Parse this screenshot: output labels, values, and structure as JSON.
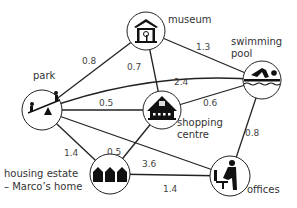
{
  "nodes": {
    "museum": {
      "label": "museum",
      "x": 146,
      "y": 31
    },
    "park": {
      "label": "park",
      "x": 42,
      "y": 110
    },
    "shopping": {
      "label1": "shopping",
      "label2": "centre",
      "x": 162,
      "y": 110
    },
    "pool": {
      "label1": "swimming",
      "label2": "pool",
      "x": 262,
      "y": 80
    },
    "housing": {
      "label1": "housing estate",
      "label2": "– Marco’s home",
      "x": 110,
      "y": 174
    },
    "offices": {
      "label": "offices",
      "x": 230,
      "y": 176
    }
  },
  "edges": [
    {
      "from": "park",
      "to": "museum",
      "weight": "0.8"
    },
    {
      "from": "museum",
      "to": "pool",
      "weight": "1.3"
    },
    {
      "from": "museum",
      "to": "shopping",
      "weight": "0.7"
    },
    {
      "from": "park",
      "to": "pool",
      "weight": "2.4"
    },
    {
      "from": "park",
      "to": "shopping",
      "weight": "0.5"
    },
    {
      "from": "shopping",
      "to": "pool",
      "weight": "0.6"
    },
    {
      "from": "park",
      "to": "housing",
      "weight": "1.4"
    },
    {
      "from": "park",
      "to": "offices",
      "weight": "3.6"
    },
    {
      "from": "housing",
      "to": "shopping",
      "weight": "0.5"
    },
    {
      "from": "housing",
      "to": "offices",
      "weight": "1.4"
    },
    {
      "from": "pool",
      "to": "offices",
      "weight": "0.8"
    }
  ],
  "colors": {
    "line": "#222222",
    "icon": "#111111",
    "circle_fill": "#ffffff"
  }
}
